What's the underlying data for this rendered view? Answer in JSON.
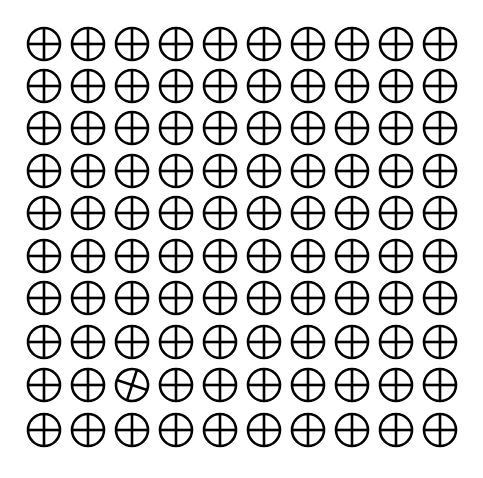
{
  "puzzle": {
    "type": "odd-one-out grid",
    "rows": 10,
    "cols": 10,
    "symbol": "circle-with-cross",
    "odd_item": {
      "row": 9,
      "col": 3,
      "rotation_deg": 18
    },
    "col_x": [
      44,
      88,
      132,
      176,
      220,
      264,
      308,
      352,
      396,
      440
    ],
    "row_y": [
      44,
      86,
      128,
      171,
      213,
      256,
      298,
      342,
      385,
      430
    ],
    "radius": 16,
    "stroke_width": 2.6,
    "stroke_color": "#000000",
    "background": "#ffffff"
  }
}
